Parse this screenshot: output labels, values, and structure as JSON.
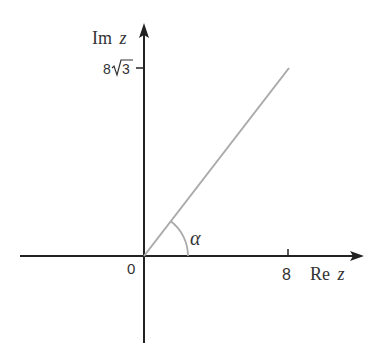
{
  "diagram": {
    "type": "complex-plane",
    "axes": {
      "x_label_main": "Re",
      "x_label_var": "z",
      "y_label_main": "Im",
      "y_label_var": "z",
      "origin_label": "0"
    },
    "ticks": {
      "x": [
        {
          "value": 8,
          "label": "8"
        }
      ],
      "y": [
        {
          "value": "8√3",
          "label_coef": "8",
          "label_radicand": "3"
        }
      ]
    },
    "ray": {
      "from": [
        0,
        0
      ],
      "to": [
        8,
        "8√3"
      ],
      "color": "#aaaaaa"
    },
    "angle": {
      "label": "α",
      "color": "#aaaaaa"
    },
    "colors": {
      "axis": "#222222",
      "ray": "#aaaaaa",
      "text": "#333333"
    }
  }
}
